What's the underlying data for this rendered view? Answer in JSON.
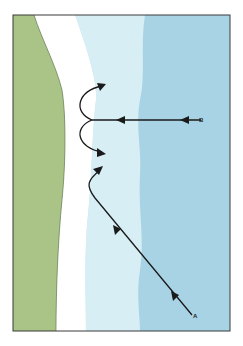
{
  "diagram": {
    "type": "wave-refraction-shoreline",
    "colors": {
      "land": "#a9c486",
      "beach": "#ffffff",
      "shallow_water": "#d6eef4",
      "deep_water": "#a8d3e4",
      "frame": "#3a3a3a",
      "arrow": "#1a1a1a"
    },
    "labels": {
      "a": "A",
      "b": "B"
    },
    "arrows": [
      {
        "name": "wave-path-a",
        "from": "A",
        "description": "diagonal approach, curves north along shore"
      },
      {
        "name": "wave-path-b",
        "from": "B",
        "description": "straight shore-normal approach, splits into two curving arrows"
      }
    ]
  }
}
